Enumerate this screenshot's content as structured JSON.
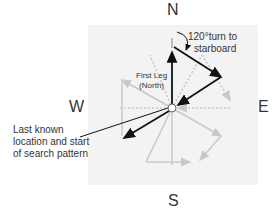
{
  "compass": {
    "north": "N",
    "south": "S",
    "east": "E",
    "west": "W"
  },
  "labels": {
    "turn_line1": "120°turn to",
    "turn_line2": "starboard",
    "first_leg_line1": "First Leg",
    "first_leg_line2": "(North)",
    "start_line1": "Last known",
    "start_line2": "location and start",
    "start_line3": "of search pattern"
  },
  "colors": {
    "primary_leg": "#111111",
    "faded_leg": "#c8c8c8",
    "background": "#f3f3f3"
  }
}
